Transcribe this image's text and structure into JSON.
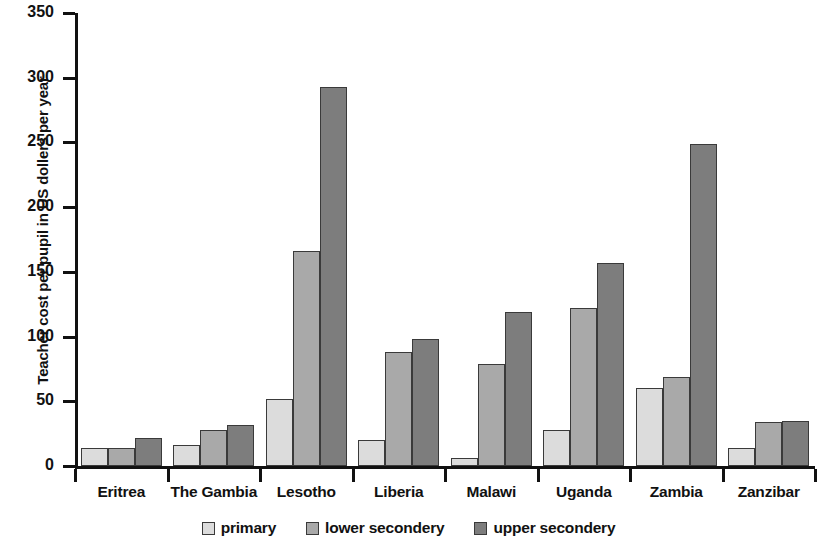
{
  "chart_data": {
    "type": "bar",
    "title": "",
    "xlabel": "",
    "ylabel": "Teacher cost per pupil in US dollers per year",
    "ylim": [
      0,
      350
    ],
    "ytick_labels": [
      "0",
      "50",
      "100",
      "150",
      "200",
      "250",
      "300",
      "350"
    ],
    "ytick_values": [
      0,
      50,
      100,
      150,
      200,
      250,
      300,
      350
    ],
    "grid": false,
    "legend_position": "bottom-center",
    "categories": [
      "Eritrea",
      "The Gambia",
      "Lesotho",
      "Liberia",
      "Malawi",
      "Uganda",
      "Zambia",
      "Zanzibar"
    ],
    "series": [
      {
        "name": "primary",
        "color": "#dcdcdc",
        "values": [
          14,
          16,
          52,
          20,
          6,
          28,
          60,
          14
        ]
      },
      {
        "name": "lower secondery",
        "color": "#a9a9a9",
        "values": [
          14,
          28,
          166,
          88,
          79,
          122,
          69,
          34
        ]
      },
      {
        "name": "upper secondery",
        "color": "#7d7d7d",
        "values": [
          22,
          32,
          293,
          98,
          119,
          157,
          249,
          35
        ]
      }
    ]
  },
  "colors": {
    "axis": "#111111",
    "primary": "#dcdcdc",
    "lower_secondary": "#a9a9a9",
    "upper_secondary": "#7d7d7d",
    "bar_outline": "#3a3a3a",
    "background": "#ffffff"
  }
}
